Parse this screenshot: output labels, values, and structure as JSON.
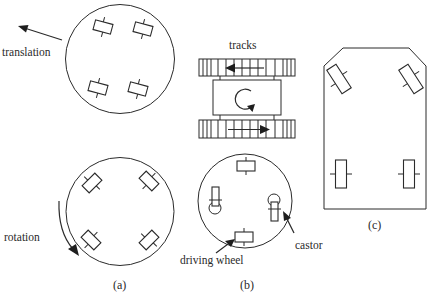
{
  "figure": {
    "panels": [
      {
        "id": "a",
        "caption": "(a)",
        "description": "Circular base with four steerable wheels",
        "labels": {
          "translation": "translation",
          "rotation": "rotation"
        }
      },
      {
        "id": "b",
        "caption": "(b)",
        "description": "Tracked vehicle and circular base with driving wheels and castors",
        "labels": {
          "tracks": "tracks",
          "driving_wheel": "driving wheel",
          "castor": "castor"
        }
      },
      {
        "id": "c",
        "caption": "(c)",
        "description": "Car-like chassis with two steered front wheels and two fixed rear wheels"
      }
    ]
  },
  "colors": {
    "stroke": "#2b2b2b",
    "text": "#2a2a2a",
    "background": "#ffffff"
  }
}
